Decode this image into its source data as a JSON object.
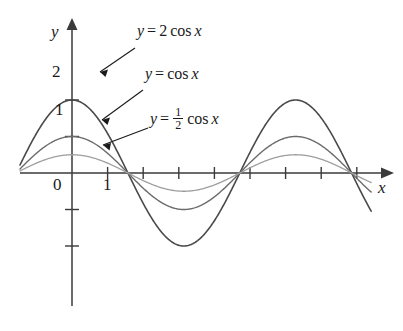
{
  "chart_data": {
    "type": "line",
    "title": "",
    "xlabel": "x",
    "ylabel": "y",
    "grid": false,
    "legend_position": "inline-annotations",
    "xlim": [
      -1.4,
      9.2
    ],
    "ylim": [
      -2.6,
      2.9
    ],
    "x_ticks": [
      1,
      2,
      3,
      4,
      5,
      6,
      7,
      8
    ],
    "x_tick_labels": [
      "1",
      "",
      "",
      "",
      "",
      "",
      "",
      ""
    ],
    "y_ticks": [
      1,
      2,
      -1,
      -2
    ],
    "y_tick_labels": [
      "1",
      "2",
      "",
      ""
    ],
    "origin_label": "0",
    "series": [
      {
        "name": "y = 2 cos x",
        "label": "y = 2 cos x",
        "amplitude": 2,
        "color": "#4a4a4a",
        "width": 1.6,
        "x": [
          -1.4,
          -1.0,
          -0.5,
          0,
          0.5,
          1.0,
          1.5708,
          2.0,
          2.5,
          3.1416,
          3.5,
          4.0,
          4.5,
          4.7124,
          5.0,
          5.5,
          6.0,
          6.2832,
          6.8,
          7.4,
          8.0,
          8.6,
          9.2
        ],
        "y": [
          0.34,
          1.08,
          1.76,
          2.0,
          1.76,
          1.08,
          0,
          -0.83,
          -1.6,
          -2.0,
          -1.87,
          -1.31,
          -0.42,
          0,
          0.57,
          1.42,
          1.92,
          2.0,
          1.72,
          0.96,
          -0.29,
          -1.39,
          -1.97
        ]
      },
      {
        "name": "y = cos x",
        "label": "y = cos x",
        "amplitude": 1,
        "color": "#6b6b6b",
        "width": 1.4,
        "x": [
          -1.4,
          -1.0,
          -0.5,
          0,
          0.5,
          1.0,
          1.5708,
          2.0,
          2.5,
          3.1416,
          3.5,
          4.0,
          4.5,
          4.7124,
          5.0,
          5.5,
          6.0,
          6.2832,
          6.8,
          7.4,
          8.0,
          8.6,
          9.2
        ],
        "y": [
          0.17,
          0.54,
          0.88,
          1.0,
          0.88,
          0.54,
          0,
          -0.42,
          -0.8,
          -1.0,
          -0.94,
          -0.65,
          -0.21,
          0,
          0.28,
          0.71,
          0.96,
          1.0,
          0.87,
          0.48,
          -0.15,
          -0.7,
          -0.99
        ]
      },
      {
        "name": "y = 1/2 cos x",
        "label": "y = ½ cos x",
        "amplitude": 0.5,
        "color": "#9e9e9e",
        "width": 1.3,
        "x": [
          -1.4,
          -1.0,
          -0.5,
          0,
          0.5,
          1.0,
          1.5708,
          2.0,
          2.5,
          3.1416,
          3.5,
          4.0,
          4.5,
          4.7124,
          5.0,
          5.5,
          6.0,
          6.2832,
          6.8,
          7.4,
          8.0,
          8.6,
          9.2
        ],
        "y": [
          0.085,
          0.27,
          0.44,
          0.5,
          0.44,
          0.27,
          0,
          -0.21,
          -0.4,
          -0.5,
          -0.47,
          -0.33,
          -0.105,
          0,
          0.14,
          0.35,
          0.48,
          0.5,
          0.43,
          0.24,
          -0.07,
          -0.35,
          -0.49
        ]
      }
    ],
    "annotations": [
      {
        "name": "label-2cos",
        "text_main": "y = 2 cos x",
        "target_series": 0
      },
      {
        "name": "label-cos",
        "text_main": "y = cos x",
        "target_series": 1
      },
      {
        "name": "label-halfcos",
        "text_main": "y = ½ cos x",
        "target_series": 2
      }
    ]
  },
  "labels": {
    "y_axis": "y",
    "x_axis": "x",
    "origin": "0",
    "tick_1_x": "1",
    "tick_1_y": "1",
    "tick_2_y": "2",
    "eq1_lhs": "y",
    "eq1_eq": "=",
    "eq1_coef": "2",
    "eq1_fn": "cos",
    "eq1_var": "x",
    "eq2_lhs": "y",
    "eq2_eq": "=",
    "eq2_fn": "cos",
    "eq2_var": "x",
    "eq3_lhs": "y",
    "eq3_eq": "=",
    "eq3_num": "1",
    "eq3_den": "2",
    "eq3_fn": "cos",
    "eq3_var": "x"
  },
  "colors": {
    "axis": "#3a3a3a",
    "curve_2cos": "#4a4a4a",
    "curve_cos": "#6b6b6b",
    "curve_halfcos": "#9e9e9e",
    "text": "#1a1a1a",
    "background": "#ffffff"
  }
}
